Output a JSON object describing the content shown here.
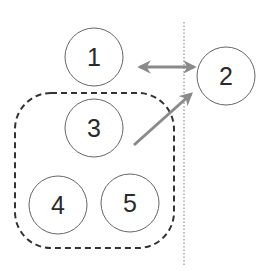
{
  "diagram": {
    "nodes": [
      {
        "id": "1",
        "label": "1",
        "cx": 94,
        "cy": 57,
        "r": 29
      },
      {
        "id": "2",
        "label": "2",
        "cx": 226,
        "cy": 76,
        "r": 29
      },
      {
        "id": "3",
        "label": "3",
        "cx": 94,
        "cy": 128,
        "r": 29
      },
      {
        "id": "4",
        "label": "4",
        "cx": 58,
        "cy": 205,
        "r": 29
      },
      {
        "id": "5",
        "label": "5",
        "cx": 130,
        "cy": 203,
        "r": 29
      }
    ],
    "group": {
      "members": [
        "3",
        "4",
        "5"
      ],
      "style": "dashed rounded rectangle"
    },
    "divider": {
      "style": "dotted vertical line"
    },
    "edges": [
      {
        "from": "1",
        "to": "2",
        "type": "bidirectional arrow"
      },
      {
        "from": "3",
        "to": "2",
        "type": "directed arrow"
      }
    ],
    "colors": {
      "stroke": "#555555",
      "arrow": "#8a8a8a",
      "text": "#2a2a2a",
      "background": "#ffffff"
    }
  }
}
